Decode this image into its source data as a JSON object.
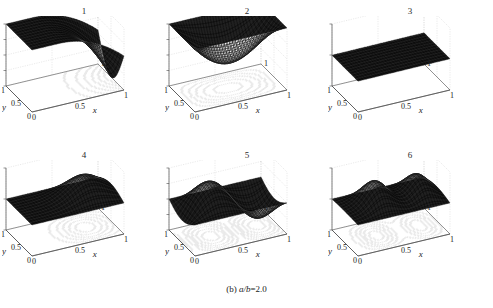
{
  "figure": {
    "caption_prefix": "(b) ",
    "caption_expr": "a/b",
    "caption_suffix": "=2.0",
    "background": "#ffffff",
    "surface_color": "#111111",
    "grid_color": "#c9c9c9",
    "axis_color": "#4a4a4a",
    "contour_color": "#b4b4b4"
  },
  "chart_data": [
    {
      "type": "surface",
      "title": "1",
      "xlabel": "x",
      "ylabel": "y",
      "zlabel": "",
      "xticks": [
        "0",
        "0.5",
        "1"
      ],
      "yticks": [
        "1",
        "0.5",
        "0"
      ],
      "zticks": [
        "0",
        "-0.01",
        "-0.02",
        "-0.03",
        "-0.04"
      ],
      "xlim": [
        0,
        1
      ],
      "ylim": [
        0,
        1
      ],
      "zlim": [
        -0.04,
        0
      ],
      "grid": true,
      "contour_base": true,
      "shape": "single-trough-right",
      "description": "Dark mesh sheet near zero over most of domain, dipping to a deep trough toward large x; minimum about -0.04",
      "z_min": -0.04,
      "z_max": 0.0
    },
    {
      "type": "surface",
      "title": "2",
      "xlabel": "x",
      "ylabel": "y",
      "zlabel": "",
      "xticks": [
        "0",
        "0.5",
        "1"
      ],
      "yticks": [
        "1",
        "0.5",
        "0"
      ],
      "zticks": [
        "0",
        "-0.01",
        "-0.02",
        "-0.03",
        "-0.04"
      ],
      "xlim": [
        0,
        1
      ],
      "ylim": [
        0,
        1
      ],
      "zlim": [
        -0.04,
        0
      ],
      "grid": true,
      "contour_base": true,
      "shape": "central-bowl",
      "description": "Flat near zero at edges with a single central depression; concentric oval contours on base plane; minimum about -0.03",
      "z_min": -0.03,
      "z_max": 0.0
    },
    {
      "type": "surface",
      "title": "3",
      "xlabel": "x",
      "ylabel": "y",
      "zlabel": "",
      "xticks": [
        "0",
        "0.5",
        "1"
      ],
      "yticks": [
        "1",
        "0.5",
        "0"
      ],
      "zticks": [
        "0.05",
        "0",
        "-0.05"
      ],
      "xlim": [
        0,
        1
      ],
      "ylim": [
        0,
        1
      ],
      "zlim": [
        -0.05,
        0.05
      ],
      "grid": true,
      "contour_base": true,
      "shape": "gentle-tilted-sheet",
      "description": "Nearly flat dark sheet with slight rise in mid-domain, small amplitude relative to +/-0.05 axis",
      "z_min": -0.01,
      "z_max": 0.012
    },
    {
      "type": "surface",
      "title": "4",
      "xlabel": "x",
      "ylabel": "y",
      "zlabel": "",
      "xticks": [
        "0",
        "0.5",
        "1"
      ],
      "yticks": [
        "1",
        "0.5",
        "0"
      ],
      "zticks": [
        "0.05",
        "0",
        "-0.05"
      ],
      "xlim": [
        0,
        1
      ],
      "ylim": [
        0,
        1
      ],
      "zlim": [
        -0.05,
        0.05
      ],
      "grid": true,
      "contour_base": true,
      "shape": "single-ridge-right",
      "description": "Flat near zero at small x rising to a broad ridge crest near large x then dropping back",
      "z_min": -0.005,
      "z_max": 0.04
    },
    {
      "type": "surface",
      "title": "5",
      "xlabel": "x",
      "ylabel": "y",
      "zlabel": "",
      "xticks": [
        "0",
        "0.5",
        "1"
      ],
      "yticks": [
        "1",
        "0.5",
        "0"
      ],
      "zticks": [
        "0.02",
        "0.01",
        "0",
        "-0.01",
        "-0.02"
      ],
      "xlim": [
        0,
        1
      ],
      "ylim": [
        0,
        1
      ],
      "zlim": [
        -0.02,
        0.02
      ],
      "grid": true,
      "contour_base": true,
      "shape": "saddle-peak-and-trough",
      "description": "Anti-symmetric saddle: a crest on one side and a trough on the other, crossing zero near the middle",
      "z_min": -0.015,
      "z_max": 0.018
    },
    {
      "type": "surface",
      "title": "6",
      "xlabel": "x",
      "ylabel": "y",
      "zlabel": "",
      "xticks": [
        "0",
        "0.5",
        "1"
      ],
      "yticks": [
        "1",
        "0.5",
        "0"
      ],
      "zticks": [
        "0.05",
        "0",
        "-0.05"
      ],
      "xlim": [
        0,
        1
      ],
      "ylim": [
        0,
        1
      ],
      "zlim": [
        -0.05,
        0.05
      ],
      "grid": true,
      "contour_base": true,
      "shape": "double-ridge",
      "description": "Two parallel ridge crests separated by a valley running across the domain",
      "z_min": -0.02,
      "z_max": 0.045
    }
  ]
}
